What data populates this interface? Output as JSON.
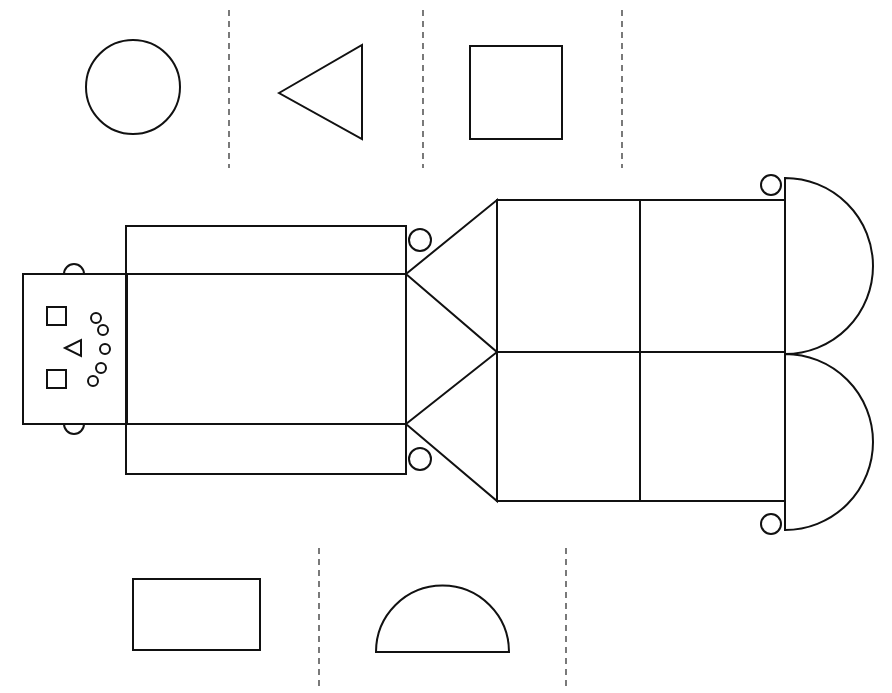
{
  "diagram": {
    "title": "",
    "colors": {
      "stroke": "#111111",
      "background": "#ffffff"
    },
    "shapes_top_row": [
      "circle",
      "triangle",
      "square"
    ],
    "shapes_bottom_row": [
      "rectangle",
      "semicircle"
    ],
    "robot_parts": [
      "head",
      "face-eyes-squares",
      "face-nose-triangle",
      "face-mouth-circles",
      "ears",
      "neck-rectangle",
      "body",
      "arms-triangles",
      "legs",
      "feet-semicircles",
      "hands-circles"
    ]
  }
}
